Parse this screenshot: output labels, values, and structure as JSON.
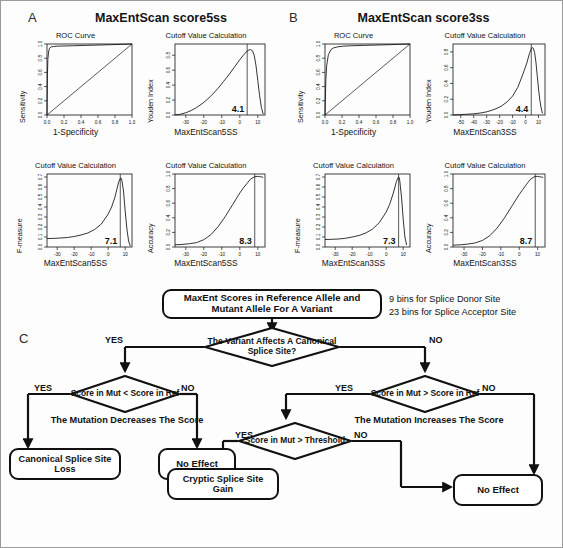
{
  "figure": {
    "panels": [
      {
        "letter": "A",
        "title": "MaxEntScan score5ss"
      },
      {
        "letter": "B",
        "title": "MaxEntScan score3ss"
      },
      {
        "letter": "C",
        "title": ""
      }
    ]
  },
  "chart_data": [
    {
      "id": "a-roc",
      "type": "line",
      "panel": "A",
      "title": "ROC Curve",
      "xlabel": "1-Specificity",
      "ylabel": "Sensitivity",
      "xlim": [
        0,
        1
      ],
      "ylim": [
        0,
        1
      ],
      "xticks": [
        "0.0",
        "0.2",
        "0.4",
        "0.6",
        "0.8",
        "1.0"
      ],
      "yticks": [
        "0.0",
        "0.2",
        "0.4",
        "0.6",
        "0.8",
        "1.0"
      ],
      "grid": false,
      "legend": "none",
      "series": [
        {
          "name": "ROC",
          "x": [
            0,
            0.005,
            0.01,
            0.02,
            0.03,
            0.05,
            0.08,
            0.12,
            0.2,
            0.3,
            0.45,
            0.6,
            0.8,
            1.0
          ],
          "y": [
            0,
            0.55,
            0.78,
            0.9,
            0.94,
            0.96,
            0.965,
            0.97,
            0.972,
            0.975,
            0.98,
            0.985,
            0.992,
            1.0
          ]
        },
        {
          "name": "Chance diagonal",
          "x": [
            0,
            1
          ],
          "y": [
            0,
            1
          ]
        }
      ]
    },
    {
      "id": "a-youden",
      "type": "line",
      "panel": "A",
      "title": "Cutoff Value Calculation",
      "xlabel": "MaxEntScan5SS",
      "ylabel": "Youden Index",
      "xlim": [
        -36,
        14
      ],
      "ylim": [
        0,
        0.95
      ],
      "xticks": [
        "-30",
        "-20",
        "-10",
        "0",
        "10"
      ],
      "yticks": [
        "0.0",
        "0.2",
        "0.4",
        "0.6",
        "0.8"
      ],
      "grid": false,
      "legend": "none",
      "cutoff_label": "4.1",
      "cutoff_value": 4.1,
      "series": [
        {
          "name": "Youden index",
          "x": [
            -36,
            -33,
            -30,
            -27,
            -24,
            -21,
            -18,
            -15,
            -12,
            -9,
            -6,
            -3,
            0,
            2,
            4,
            5,
            6,
            7,
            8,
            9,
            10,
            11,
            12,
            13
          ],
          "y": [
            0.0,
            0.01,
            0.03,
            0.06,
            0.1,
            0.15,
            0.21,
            0.28,
            0.36,
            0.45,
            0.54,
            0.64,
            0.74,
            0.8,
            0.855,
            0.87,
            0.875,
            0.86,
            0.8,
            0.66,
            0.46,
            0.26,
            0.1,
            0.01
          ]
        }
      ]
    },
    {
      "id": "a-fmeasure",
      "type": "line",
      "panel": "A",
      "title": "Cutoff Value Calculation",
      "xlabel": "MaxEntScan5SS",
      "ylabel": "F-measure",
      "xlim": [
        -36,
        14
      ],
      "ylim": [
        0,
        0.73
      ],
      "xticks": [
        "-30",
        "-20",
        "-10",
        "0",
        "10"
      ],
      "yticks": [
        "0.0",
        "0.1",
        "0.2",
        "0.3",
        "0.4",
        "0.5",
        "0.6",
        "0.7"
      ],
      "grid": false,
      "legend": "none",
      "cutoff_label": "7.1",
      "cutoff_value": 7.1,
      "series": [
        {
          "name": "F-measure",
          "x": [
            -36,
            -32,
            -28,
            -24,
            -20,
            -16,
            -12,
            -8,
            -4,
            0,
            2,
            4,
            5,
            6,
            7,
            7.5,
            8,
            9,
            10,
            11,
            12,
            13
          ],
          "y": [
            0.085,
            0.086,
            0.09,
            0.095,
            0.105,
            0.12,
            0.14,
            0.175,
            0.23,
            0.33,
            0.4,
            0.5,
            0.57,
            0.64,
            0.685,
            0.69,
            0.67,
            0.56,
            0.36,
            0.18,
            0.06,
            0.01
          ]
        }
      ]
    },
    {
      "id": "a-accuracy",
      "type": "line",
      "panel": "A",
      "title": "Cutoff Value Calculation",
      "xlabel": "MaxEntScan5SS",
      "ylabel": "Accuracy",
      "xlim": [
        -36,
        14
      ],
      "ylim": [
        0,
        1
      ],
      "xticks": [
        "-30",
        "-20",
        "-10",
        "0",
        "10"
      ],
      "yticks": [
        "0.0",
        "0.2",
        "0.4",
        "0.6",
        "0.8",
        "1.0"
      ],
      "grid": false,
      "legend": "none",
      "cutoff_label": "8.3",
      "cutoff_value": 8.3,
      "series": [
        {
          "name": "Accuracy",
          "x": [
            -36,
            -32,
            -28,
            -24,
            -20,
            -16,
            -12,
            -8,
            -4,
            0,
            2,
            4,
            6,
            8,
            9,
            10,
            11,
            12,
            13
          ],
          "y": [
            0.03,
            0.035,
            0.045,
            0.06,
            0.1,
            0.17,
            0.28,
            0.42,
            0.58,
            0.74,
            0.81,
            0.87,
            0.93,
            0.96,
            0.965,
            0.968,
            0.965,
            0.96,
            0.955
          ]
        }
      ]
    },
    {
      "id": "b-roc",
      "type": "line",
      "panel": "B",
      "title": "ROC Curve",
      "xlabel": "1-Specificity",
      "ylabel": "Sensitivity",
      "xlim": [
        0,
        1
      ],
      "ylim": [
        0,
        1
      ],
      "xticks": [
        "0.0",
        "0.2",
        "0.4",
        "0.6",
        "0.8",
        "1.0"
      ],
      "yticks": [
        "0.0",
        "0.2",
        "0.4",
        "0.6",
        "0.8",
        "1.0"
      ],
      "grid": false,
      "legend": "none",
      "series": [
        {
          "name": "ROC",
          "x": [
            0,
            0.01,
            0.02,
            0.04,
            0.07,
            0.1,
            0.15,
            0.22,
            0.3,
            0.45,
            0.6,
            0.8,
            1.0
          ],
          "y": [
            0,
            0.5,
            0.7,
            0.85,
            0.92,
            0.945,
            0.96,
            0.97,
            0.975,
            0.98,
            0.985,
            0.992,
            1.0
          ]
        },
        {
          "name": "Chance diagonal",
          "x": [
            0,
            1
          ],
          "y": [
            0,
            1
          ]
        }
      ]
    },
    {
      "id": "b-youden",
      "type": "line",
      "panel": "B",
      "title": "Cutoff Value Calculation",
      "xlabel": "MaxEntScan3SS",
      "ylabel": "Youden Index",
      "xlim": [
        -56,
        15
      ],
      "ylim": [
        0,
        0.9
      ],
      "xticks": [
        "-50",
        "-40",
        "-30",
        "-20",
        "-10",
        "0",
        "10"
      ],
      "yticks": [
        "0.0",
        "0.2",
        "0.4",
        "0.6",
        "0.8"
      ],
      "grid": false,
      "legend": "none",
      "cutoff_label": "4.4",
      "cutoff_value": 4.4,
      "series": [
        {
          "name": "Youden index",
          "x": [
            -56,
            -50,
            -45,
            -40,
            -35,
            -30,
            -26,
            -22,
            -18,
            -14,
            -10,
            -6,
            -2,
            1,
            3,
            4.4,
            5,
            6,
            7,
            8,
            9,
            10,
            11,
            12,
            13
          ],
          "y": [
            0.0,
            0.005,
            0.01,
            0.015,
            0.025,
            0.04,
            0.06,
            0.085,
            0.12,
            0.17,
            0.24,
            0.35,
            0.52,
            0.66,
            0.78,
            0.84,
            0.855,
            0.845,
            0.79,
            0.67,
            0.5,
            0.33,
            0.19,
            0.09,
            0.02
          ]
        }
      ]
    },
    {
      "id": "b-fmeasure",
      "type": "line",
      "panel": "B",
      "title": "Cutoff Value Calculation",
      "xlabel": "MaxEntScan3SS",
      "ylabel": "F-measure",
      "xlim": [
        -36,
        14
      ],
      "ylim": [
        0,
        0.73
      ],
      "xticks": [
        "-30",
        "-20",
        "-10",
        "0",
        "10"
      ],
      "yticks": [
        "0.0",
        "0.1",
        "0.2",
        "0.3",
        "0.4",
        "0.5",
        "0.6",
        "0.7"
      ],
      "grid": false,
      "legend": "none",
      "cutoff_label": "7.3",
      "cutoff_value": 7.3,
      "series": [
        {
          "name": "F-measure",
          "x": [
            -36,
            -32,
            -28,
            -24,
            -20,
            -16,
            -12,
            -8,
            -4,
            0,
            2,
            4,
            5,
            6,
            7,
            7.5,
            8,
            9,
            10,
            11,
            12
          ],
          "y": [
            0.075,
            0.077,
            0.08,
            0.087,
            0.1,
            0.115,
            0.14,
            0.18,
            0.245,
            0.35,
            0.425,
            0.53,
            0.59,
            0.655,
            0.695,
            0.7,
            0.66,
            0.5,
            0.28,
            0.1,
            0.02
          ]
        }
      ]
    },
    {
      "id": "b-accuracy",
      "type": "line",
      "panel": "B",
      "title": "Cutoff Value Calculation",
      "xlabel": "MaxEntScan3SS",
      "ylabel": "Accuracy",
      "xlim": [
        -36,
        14
      ],
      "ylim": [
        0,
        1
      ],
      "xticks": [
        "-30",
        "-20",
        "-10",
        "0",
        "10"
      ],
      "yticks": [
        "0.0",
        "0.2",
        "0.4",
        "0.6",
        "0.8",
        "1.0"
      ],
      "grid": false,
      "legend": "none",
      "cutoff_label": "8.7",
      "cutoff_value": 8.7,
      "series": [
        {
          "name": "Accuracy",
          "x": [
            -36,
            -32,
            -28,
            -24,
            -20,
            -16,
            -12,
            -8,
            -4,
            0,
            2,
            4,
            6,
            8,
            9,
            10,
            11,
            12,
            13
          ],
          "y": [
            0.025,
            0.03,
            0.04,
            0.055,
            0.09,
            0.155,
            0.26,
            0.4,
            0.56,
            0.72,
            0.79,
            0.86,
            0.925,
            0.96,
            0.965,
            0.968,
            0.962,
            0.958,
            0.955
          ]
        }
      ]
    }
  ],
  "flowchart": {
    "start_node": "MaxEnt Scores in Reference Allele and Mutant Allele For A Variant",
    "note_lines": [
      "9 bins for Splice Donor Site",
      "23 bins for Splice Acceptor Site"
    ],
    "decision_main": "The Variant Affects A Canonical Splice Site?",
    "decision_left": "Score in Mut < Score in Ref",
    "decision_right": "Score in Mut > Score in Ref",
    "decision_threshold": "Score in Mut > Threshold",
    "caption_left": "The Mutation Decreases The Score",
    "caption_right": "The Mutation Increases The Score",
    "outcome_canonical_loss": "Canonical Splice Site Loss",
    "outcome_no_effect_left": "No Effect",
    "outcome_cryptic_gain": "Cryptic Splice Site Gain",
    "outcome_no_effect_right": "No Effect",
    "labels": {
      "yes": "YES",
      "no": "NO"
    }
  }
}
